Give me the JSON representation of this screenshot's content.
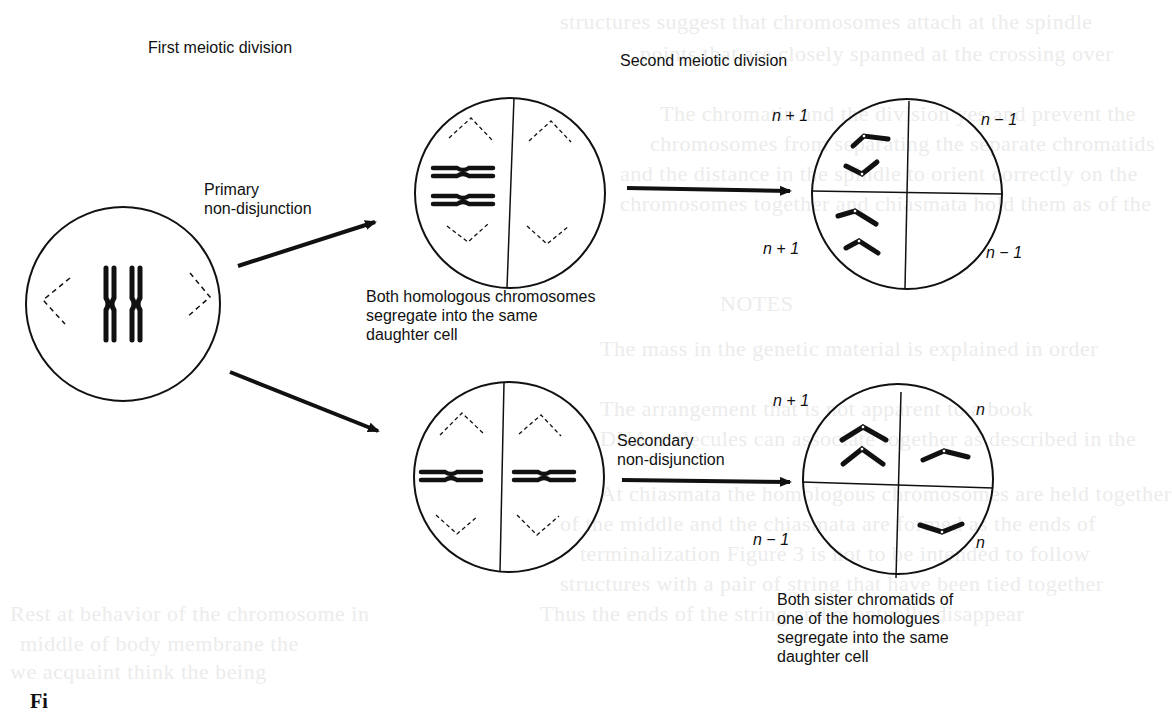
{
  "figure": {
    "headings": {
      "first_division": "First meiotic division",
      "second_division": "Second meiotic division"
    },
    "arrows": {
      "primary": {
        "label_line1": "Primary",
        "label_line2": "non-disjunction"
      },
      "secondary": {
        "label_line1": "Secondary",
        "label_line2": "non-disjunction"
      }
    },
    "captions": {
      "homologous": {
        "line1": "Both homologous chromosomes",
        "line2": "segregate into the same",
        "line3": "daughter cell"
      },
      "sister": {
        "line1": "Both sister chromatids of",
        "line2": "one of the homologues",
        "line3": "segregate into the same",
        "line4": "daughter cell"
      }
    },
    "cells": {
      "parent": {
        "contents": "pair of homologous chromosomes (XX) with spindle poles"
      },
      "primary_first_division": {
        "left_half": "two homologues",
        "right_half": "empty"
      },
      "secondary_first_division": {
        "left_half": "one homologue",
        "right_half": "one homologue"
      },
      "primary_gametes": {
        "top_left": "n + 1",
        "top_right": "n − 1",
        "bottom_left": "n + 1",
        "bottom_right": "n − 1"
      },
      "secondary_gametes": {
        "top_left": "n + 1",
        "top_right": "n",
        "bottom_left": "n − 1",
        "bottom_right": "n"
      }
    },
    "corner_text": "Fi"
  },
  "colors": {
    "ink": "#111111",
    "paper": "#ffffff",
    "bleed_through": "#ececec"
  }
}
